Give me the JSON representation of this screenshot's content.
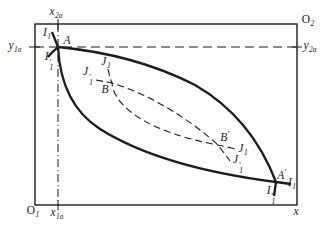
{
  "figure": {
    "kind": "edgeworth-box-indifference-curve-diagram",
    "width": 332,
    "height": 232,
    "background": "#fdfdfc",
    "ink": "#1c1c1c"
  },
  "curves": [
    {
      "id": "I1",
      "label": "I1",
      "style": "solid",
      "through": [
        "A",
        "A-prime"
      ]
    },
    {
      "id": "I1-prime",
      "label": "I1'",
      "style": "solid",
      "through": [
        "A",
        "A-prime"
      ]
    },
    {
      "id": "J1",
      "label": "J1",
      "style": "dashed",
      "through": [
        "B",
        "B-prime"
      ]
    },
    {
      "id": "J1-prime",
      "label": "J1'",
      "style": "dashed",
      "through": [
        "B",
        "B-prime"
      ]
    }
  ],
  "labels": [
    {
      "id": "x2a",
      "base": "x",
      "sub": "2a",
      "x": 56,
      "y": 13
    },
    {
      "id": "O2",
      "base": "O",
      "sub": "2",
      "upright": true,
      "x": 308,
      "y": 21
    },
    {
      "id": "y1a",
      "base": "y",
      "sub": "1a",
      "x": 15,
      "y": 47
    },
    {
      "id": "y2a",
      "base": "y",
      "sub": "2a",
      "x": 310,
      "y": 47
    },
    {
      "id": "I1-at-A",
      "base": "I",
      "sub": "1",
      "x": 47,
      "y": 34
    },
    {
      "id": "A",
      "base": "A",
      "x": 67,
      "y": 41
    },
    {
      "id": "I1-prime-at-A",
      "base": "I",
      "sub": "1",
      "prime": true,
      "x": 49,
      "y": 61
    },
    {
      "id": "J1-at-B",
      "base": "J",
      "sub": "1",
      "x": 106,
      "y": 63
    },
    {
      "id": "J1-prime-at-B",
      "base": "J",
      "sub": "1",
      "prime": true,
      "x": 88,
      "y": 76
    },
    {
      "id": "B",
      "base": "B",
      "x": 105,
      "y": 90
    },
    {
      "id": "B-prime",
      "base": "B",
      "prime": true,
      "x": 225,
      "y": 137
    },
    {
      "id": "J1-at-B-prime",
      "base": "J",
      "sub": "1",
      "x": 243,
      "y": 150
    },
    {
      "id": "J1-prime-at-B-prime",
      "base": "J",
      "sub": "1",
      "prime": true,
      "x": 238,
      "y": 164
    },
    {
      "id": "A-prime",
      "base": "A",
      "prime": true,
      "x": 282,
      "y": 175
    },
    {
      "id": "I1-at-A-prime",
      "base": "I",
      "sub": "1",
      "x": 292,
      "y": 184
    },
    {
      "id": "I1-prime-at-A-prime",
      "base": "I",
      "sub": "1",
      "prime": true,
      "x": 271,
      "y": 195
    },
    {
      "id": "O1",
      "base": "O",
      "sub": "1",
      "upright": true,
      "x": 33,
      "y": 212
    },
    {
      "id": "x1a",
      "base": "x",
      "sub": "1a",
      "x": 57,
      "y": 214
    },
    {
      "id": "x",
      "base": "x",
      "x": 296,
      "y": 212
    }
  ]
}
